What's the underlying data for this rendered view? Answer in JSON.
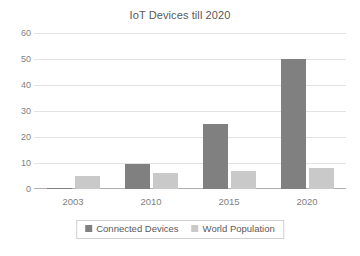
{
  "chart_data": {
    "type": "bar",
    "title": "IoT Devices till 2020",
    "xlabel": "",
    "ylabel": "",
    "categories": [
      "2003",
      "2010",
      "2015",
      "2020"
    ],
    "series": [
      {
        "name": "Connected Devices",
        "values": [
          0.5,
          9.5,
          25,
          50
        ],
        "color": "#808080"
      },
      {
        "name": "World Population",
        "values": [
          5,
          6,
          7,
          8
        ],
        "color": "#c9c9c9"
      }
    ],
    "ylim": [
      0,
      60
    ],
    "ytick_labels": [
      "0",
      "10",
      "20",
      "30",
      "40",
      "50",
      "60"
    ],
    "ytick_values": [
      0,
      10,
      20,
      30,
      40,
      50,
      60
    ],
    "grid": true,
    "legend_position": "bottom",
    "legend_border_color": "#d0d0d0",
    "axis_color": "#b0b0b0",
    "gridline_color": "#e3e3e3",
    "text_color": "#595959",
    "tick_text_color": "#7f7f7f",
    "background": "#ffffff"
  }
}
